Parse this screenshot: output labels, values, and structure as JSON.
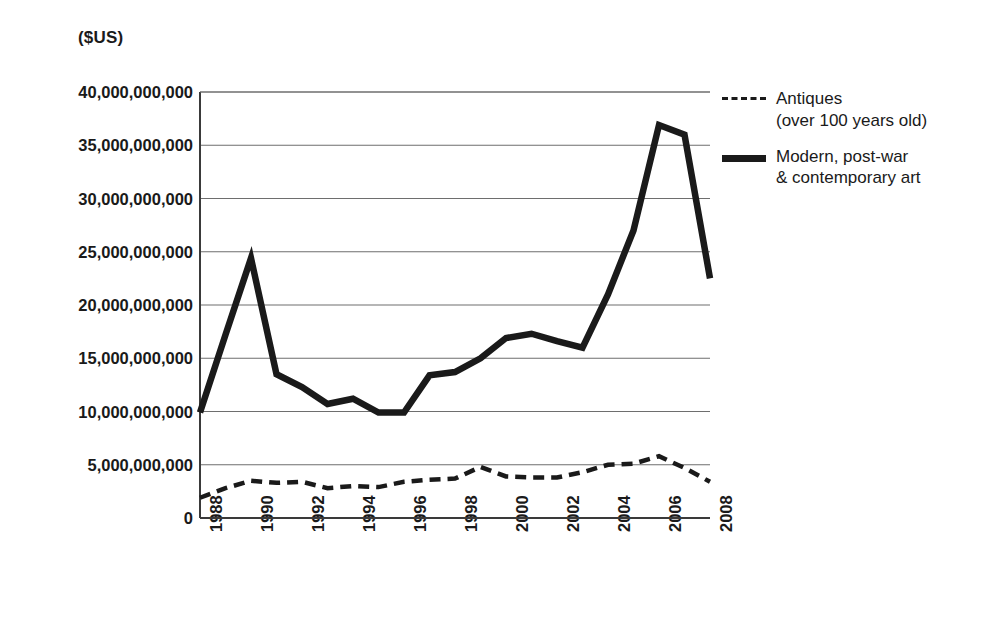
{
  "axis_unit_label": "($US)",
  "legend": {
    "position": "right",
    "entries": [
      {
        "name": "legend-antiques",
        "style": "dashed",
        "label": "Antiques\n(over 100 years old)"
      },
      {
        "name": "legend-modern",
        "style": "solid",
        "label": "Modern, post-war\n& contemporary art"
      }
    ]
  },
  "chart_data": {
    "type": "line",
    "title": "",
    "subtitle": "",
    "xlabel": "",
    "ylabel": "($US)",
    "grid": true,
    "legend_position": "right",
    "xlim": [
      1988,
      2008
    ],
    "ylim": [
      0,
      40000000000
    ],
    "ytick_values": [
      0,
      5000000000,
      10000000000,
      15000000000,
      20000000000,
      25000000000,
      30000000000,
      35000000000,
      40000000000
    ],
    "ytick_labels": [
      "0",
      "5,000,000,000",
      "10,000,000,000",
      "15,000,000,000",
      "20,000,000,000",
      "25,000,000,000",
      "30,000,000,000",
      "35,000,000,000",
      "40,000,000,000"
    ],
    "xtick_labels": [
      "1988",
      "1990",
      "1992",
      "1994",
      "1996",
      "1998",
      "2000",
      "2002",
      "2004",
      "2006",
      "2008"
    ],
    "x": [
      1988,
      1989,
      1990,
      1991,
      1992,
      1993,
      1994,
      1995,
      1996,
      1997,
      1998,
      1999,
      2000,
      2001,
      2002,
      2003,
      2004,
      2005,
      2006,
      2007,
      2008
    ],
    "series": [
      {
        "name": "Modern, post-war & contemporary art",
        "style": "solid",
        "color": "#1a1a1a",
        "values": [
          9900000000,
          17200000000,
          24400000000,
          13500000000,
          12300000000,
          10700000000,
          11200000000,
          9900000000,
          9900000000,
          13400000000,
          13700000000,
          15000000000,
          16900000000,
          17300000000,
          16600000000,
          16000000000,
          21000000000,
          27000000000,
          36900000000,
          36000000000,
          22500000000
        ]
      },
      {
        "name": "Antiques (over 100 years old)",
        "style": "dashed",
        "color": "#1a1a1a",
        "values": [
          1900000000,
          2800000000,
          3500000000,
          3300000000,
          3400000000,
          2800000000,
          3000000000,
          2900000000,
          3400000000,
          3600000000,
          3700000000,
          4800000000,
          3900000000,
          3800000000,
          3800000000,
          4300000000,
          5000000000,
          5100000000,
          5800000000,
          4700000000,
          3400000000
        ]
      }
    ]
  }
}
